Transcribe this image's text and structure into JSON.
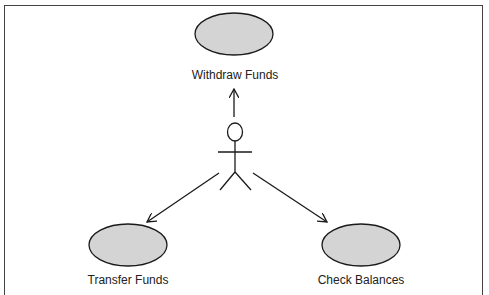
{
  "diagram": {
    "type": "uml-use-case",
    "actor": {
      "name": "",
      "x": 235,
      "head_y": 132
    },
    "use_cases": [
      {
        "id": "withdraw",
        "label": "Withdraw Funds",
        "cx": 234,
        "cy": 34,
        "rx": 39,
        "ry": 21,
        "label_x": 235,
        "label_y": 68
      },
      {
        "id": "transfer",
        "label": "Transfer Funds",
        "cx": 128,
        "cy": 245,
        "rx": 39,
        "ry": 21,
        "label_x": 128,
        "label_y": 273
      },
      {
        "id": "balances",
        "label": "Check Balances",
        "cx": 361,
        "cy": 245,
        "rx": 39,
        "ry": 21,
        "label_x": 361,
        "label_y": 273
      }
    ],
    "associations": [
      {
        "from": "actor",
        "to": "withdraw",
        "x1": 234,
        "y1": 117,
        "x2": 234,
        "y2": 88
      },
      {
        "from": "actor",
        "to": "transfer",
        "x1": 219,
        "y1": 173,
        "x2": 147,
        "y2": 222
      },
      {
        "from": "actor",
        "to": "balances",
        "x1": 253,
        "y1": 173,
        "x2": 327,
        "y2": 222
      }
    ],
    "colors": {
      "ellipse_fill": "#d4d4d4",
      "stroke": "#1a1a1a",
      "frame": "#444444"
    }
  }
}
